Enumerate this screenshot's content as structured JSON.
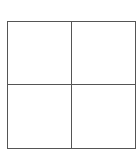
{
  "grid": {
    "rows": 2,
    "columns": 2,
    "line_color": "#555555",
    "background": "#ffffff",
    "cells": [
      {
        "row": 0,
        "col": 0,
        "text": ""
      },
      {
        "row": 0,
        "col": 1,
        "text": ""
      },
      {
        "row": 1,
        "col": 0,
        "text": ""
      },
      {
        "row": 1,
        "col": 1,
        "text": ""
      }
    ]
  }
}
